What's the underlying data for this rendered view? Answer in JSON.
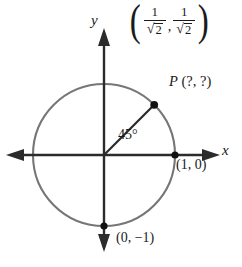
{
  "figure": {
    "cut_off_header": "Find the coordinates of",
    "axis_labels": {
      "x": "x",
      "y": "y"
    },
    "angle_label": "45°",
    "point_label": {
      "name": "P",
      "coords": "(?, ?)"
    },
    "answer_label": {
      "open_paren": "(",
      "comma": ",",
      "close_paren": ")",
      "first": {
        "numerator": "1",
        "denominator_radical": "√",
        "denominator_radicand": "2"
      },
      "second": {
        "numerator": "1",
        "denominator_radical": "√",
        "denominator_radicand": "2"
      }
    },
    "axis_point_labels": {
      "right": "(1, 0)",
      "bottom": "(0, −1)"
    },
    "colors": {
      "circle": "#767676",
      "axis": "#2b2b2b",
      "ray": "#2b2b2b",
      "point": "#111111",
      "background": "#ffffff"
    },
    "geometry": {
      "center_x": 104,
      "center_y": 155,
      "radius": 71,
      "angle_degrees": 45
    }
  }
}
